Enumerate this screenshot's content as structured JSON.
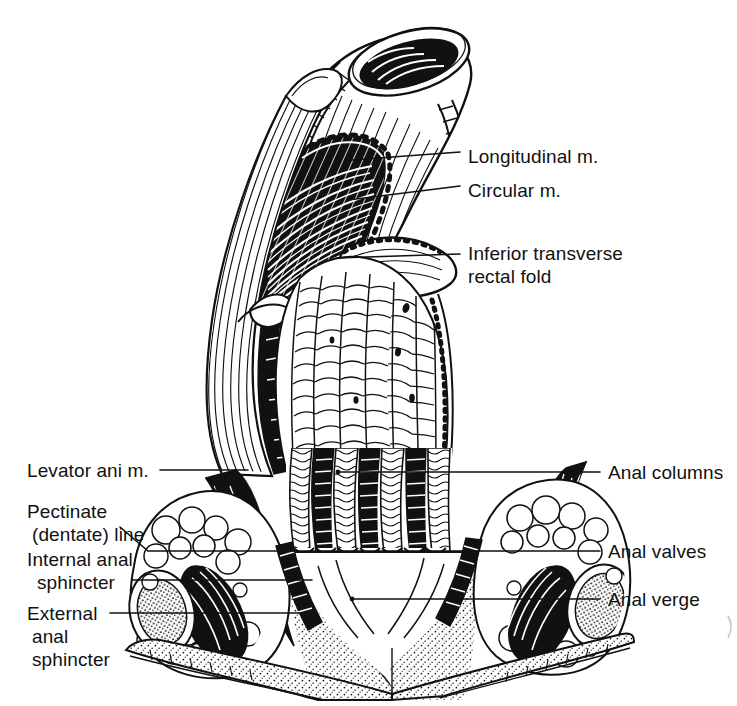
{
  "figure": {
    "style": "black and white pen-and-ink anatomical line drawing",
    "background_color": "#ffffff",
    "ink_color": "#111111",
    "width": 737,
    "height": 706
  },
  "labels": {
    "longitudinal_m": "Longitudinal m.",
    "circular_m": "Circular m.",
    "inferior_transverse_rectal_fold_line1": "Inferior transverse",
    "inferior_transverse_rectal_fold_line2": "rectal fold",
    "anal_columns": "Anal columns",
    "anal_valves": "Anal valves",
    "anal_verge": "Anal verge",
    "levator_ani_m": "Levator ani m.",
    "pectinate_line_line1": "Pectinate",
    "pectinate_line_line2": "(dentate) line",
    "internal_anal_sphincter_line1": "Internal anal",
    "internal_anal_sphincter_line2": "sphincter",
    "external_anal_sphincter_line1": "External",
    "external_anal_sphincter_line2": "anal",
    "external_anal_sphincter_line3": "sphincter"
  }
}
